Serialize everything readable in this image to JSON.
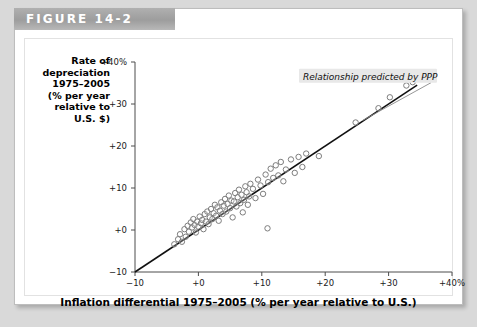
{
  "figure": {
    "header_label": "FIGURE 14-2"
  },
  "chart_data": {
    "type": "scatter",
    "title": "",
    "xlabel": "Inflation differential 1975–2005 (% per year relative to U.S.)",
    "ylabel": "Rate of depreciation 1975–2005 (% per year relative to U.S. $)",
    "ylabel_lines": [
      "Rate of",
      "depreciation",
      "1975–2005",
      "(% per year",
      "relative to",
      "U.S. $)"
    ],
    "xlim": [
      -10,
      40
    ],
    "ylim": [
      -10,
      40
    ],
    "xticks": [
      -10,
      0,
      10,
      20,
      30,
      40
    ],
    "yticks": [
      -10,
      0,
      10,
      20,
      30,
      40
    ],
    "xtick_labels": [
      "−10",
      "+0",
      "+10",
      "+20",
      "+30",
      "+40%"
    ],
    "ytick_labels": [
      "−10",
      "+0",
      "+10",
      "+20",
      "+30",
      "+40%"
    ],
    "grid": false,
    "legend": "none",
    "annotations": [
      {
        "text": "Relationship predicted by PPP",
        "x": 16.5,
        "y": 36.5,
        "leader_to_x": 25.8,
        "leader_to_y": 26.0
      }
    ],
    "reference_line": {
      "name": "45-degree PPP line",
      "from": [
        -10,
        -10
      ],
      "to": [
        34.5,
        34.5
      ],
      "slope": 1,
      "intercept": 0
    },
    "series": [
      {
        "name": "Countries",
        "marker": "open-circle",
        "points": [
          [
            -3.8,
            -3.4
          ],
          [
            -3.2,
            -2.2
          ],
          [
            -2.9,
            -1.0
          ],
          [
            -2.6,
            -2.8
          ],
          [
            -2.2,
            0.2
          ],
          [
            -2.0,
            -1.6
          ],
          [
            -1.7,
            1.0
          ],
          [
            -1.5,
            -0.4
          ],
          [
            -1.2,
            1.8
          ],
          [
            -1.0,
            0.6
          ],
          [
            -0.8,
            2.6
          ],
          [
            -0.6,
            1.2
          ],
          [
            -0.4,
            -0.6
          ],
          [
            -0.2,
            2.0
          ],
          [
            0.0,
            0.8
          ],
          [
            0.2,
            3.2
          ],
          [
            0.4,
            1.6
          ],
          [
            0.6,
            2.4
          ],
          [
            0.8,
            0.2
          ],
          [
            1.0,
            3.8
          ],
          [
            1.2,
            2.0
          ],
          [
            1.4,
            4.4
          ],
          [
            1.6,
            1.4
          ],
          [
            1.8,
            3.0
          ],
          [
            2.0,
            5.0
          ],
          [
            2.2,
            2.6
          ],
          [
            2.4,
            4.0
          ],
          [
            2.6,
            6.0
          ],
          [
            2.8,
            3.4
          ],
          [
            3.0,
            5.4
          ],
          [
            3.2,
            2.2
          ],
          [
            3.4,
            4.6
          ],
          [
            3.6,
            6.6
          ],
          [
            3.8,
            3.8
          ],
          [
            4.0,
            5.8
          ],
          [
            4.2,
            7.4
          ],
          [
            4.4,
            4.4
          ],
          [
            4.6,
            6.2
          ],
          [
            4.8,
            8.2
          ],
          [
            5.0,
            5.2
          ],
          [
            5.2,
            7.0
          ],
          [
            5.4,
            3.0
          ],
          [
            5.6,
            6.8
          ],
          [
            5.8,
            8.8
          ],
          [
            6.0,
            5.6
          ],
          [
            6.2,
            7.8
          ],
          [
            6.4,
            9.6
          ],
          [
            6.6,
            6.4
          ],
          [
            6.8,
            8.4
          ],
          [
            7.0,
            4.2
          ],
          [
            7.2,
            7.2
          ],
          [
            7.4,
            10.4
          ],
          [
            7.6,
            9.0
          ],
          [
            7.8,
            6.0
          ],
          [
            8.0,
            8.0
          ],
          [
            8.2,
            11.0
          ],
          [
            8.6,
            9.8
          ],
          [
            9.0,
            7.6
          ],
          [
            9.4,
            12.0
          ],
          [
            9.8,
            10.6
          ],
          [
            10.2,
            8.6
          ],
          [
            10.6,
            13.2
          ],
          [
            11.0,
            11.4
          ],
          [
            11.4,
            14.6
          ],
          [
            11.8,
            12.4
          ],
          [
            12.2,
            15.4
          ],
          [
            12.6,
            13.0
          ],
          [
            13.0,
            16.2
          ],
          [
            13.4,
            11.6
          ],
          [
            13.8,
            14.4
          ],
          [
            14.6,
            16.8
          ],
          [
            15.2,
            13.6
          ],
          [
            15.8,
            17.4
          ],
          [
            16.4,
            15.0
          ],
          [
            17.0,
            18.2
          ],
          [
            19.0,
            17.6
          ],
          [
            24.8,
            25.6
          ],
          [
            28.4,
            29.0
          ],
          [
            30.2,
            31.6
          ],
          [
            32.8,
            34.4
          ],
          [
            33.8,
            35.2
          ],
          [
            10.9,
            0.4
          ]
        ]
      }
    ]
  }
}
